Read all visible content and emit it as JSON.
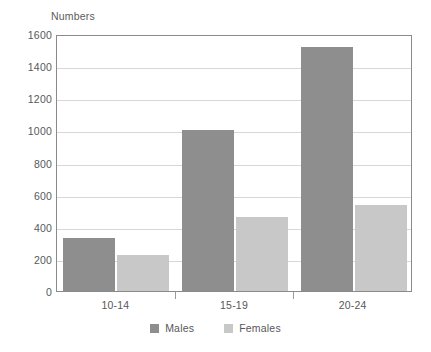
{
  "chart_data": {
    "type": "bar",
    "title": "",
    "subtitle": "",
    "xlabel": "",
    "ylabel": "Numbers",
    "categories": [
      "10-14",
      "15-19",
      "20-24"
    ],
    "series": [
      {
        "name": "Males",
        "values": [
          330,
          1000,
          1520
        ],
        "color": "#8e8e8e"
      },
      {
        "name": "Females",
        "values": [
          225,
          460,
          535
        ],
        "color": "#c8c8c8"
      }
    ],
    "ylim": [
      0,
      1600
    ],
    "ytick_step": 200,
    "yticks": [
      0,
      200,
      400,
      600,
      800,
      1000,
      1200,
      1400,
      1600
    ],
    "ytick_labels": [
      "0",
      "200",
      "400",
      "600",
      "800",
      "1000",
      "1200",
      "1400",
      "1600"
    ],
    "grid": true,
    "grid_axis": "y",
    "legend_position": "bottom",
    "orientation": "vertical",
    "grouped": true
  },
  "legend": {
    "items": [
      {
        "label": "Males",
        "swatch": "males-swatch"
      },
      {
        "label": "Females",
        "swatch": "females-swatch"
      }
    ]
  },
  "colors": {
    "males": "#8e8e8e",
    "females": "#c8c8c8",
    "grid": "#d8d8d8",
    "axis": "#8a8a8a",
    "text": "#58585a",
    "background": "#ffffff"
  }
}
